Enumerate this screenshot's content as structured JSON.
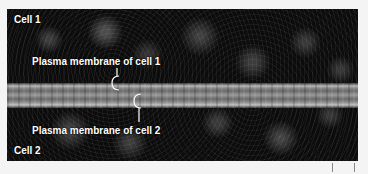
{
  "figure": {
    "type": "electron micrograph",
    "labels": {
      "cell_1": "Cell 1",
      "cell_2": "Cell 2",
      "membrane_1": "Plasma membrane of cell 1",
      "membrane_2": "Plasma membrane of cell 2"
    },
    "colors": {
      "background": "#f4f4f4",
      "micrograph": "#0c0c0c",
      "label_text": "#ffffff"
    }
  }
}
